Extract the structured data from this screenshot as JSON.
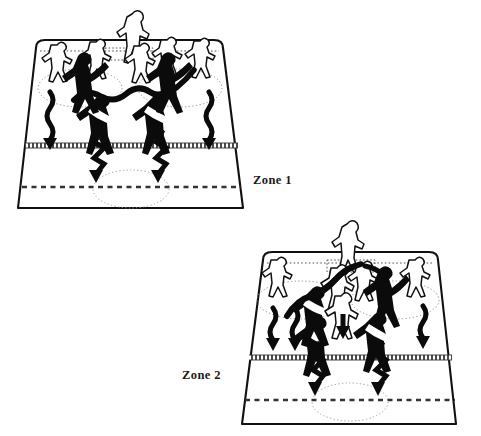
{
  "figure": {
    "type": "tactical-diagram",
    "title": "",
    "background_color": "#ffffff",
    "ink_color": "#111111",
    "hatch_color": "#5a5a5a",
    "dot_color": "#7a7a7a",
    "width": 481,
    "height": 436
  },
  "labels": {
    "zone_1": "Zone 1",
    "zone_2": "Zone 2"
  },
  "diagrams": [
    {
      "id": "diagram-1",
      "label": "Zone 1",
      "pitch": {
        "shape": "trapezoid-perspective",
        "top_width": 188,
        "bottom_width": 232,
        "rounded_top_corners": true
      },
      "lines": [
        {
          "name": "goal-line",
          "style": "dotted",
          "y": 48
        },
        {
          "name": "mid-hatched-line",
          "style": "hatched-thick",
          "y": 146
        },
        {
          "name": "far-dashed-line",
          "style": "dashed",
          "y": 186
        }
      ],
      "ellipses": [
        {
          "name": "left-zone-ellipse",
          "cx": 80,
          "cy": 88,
          "rx": 40,
          "ry": 18,
          "style": "dotted"
        },
        {
          "name": "right-zone-ellipse",
          "cx": 176,
          "cy": 88,
          "rx": 40,
          "ry": 18,
          "style": "dotted"
        },
        {
          "name": "bottom-zone-ellipse",
          "cx": 131,
          "cy": 188,
          "rx": 37,
          "ry": 18,
          "style": "dotted"
        }
      ],
      "players": {
        "outline_count": 6,
        "filled_count": 4,
        "keeper_count": 1
      },
      "arrows": {
        "wavy_down": 2,
        "zigzag_down": 2
      },
      "ball_path": {
        "name": "pass-curve",
        "style": "thick-wavy"
      }
    },
    {
      "id": "diagram-2",
      "label": "Zone 2",
      "pitch": {
        "shape": "trapezoid-perspective",
        "top_width": 188,
        "bottom_width": 232,
        "rounded_top_corners": true
      },
      "lines": [
        {
          "name": "goal-line",
          "style": "dotted",
          "y": 48
        },
        {
          "name": "mid-hatched-line",
          "style": "hatched-thick",
          "y": 140
        },
        {
          "name": "far-dashed-line",
          "style": "dashed",
          "y": 180
        }
      ],
      "ellipses": [
        {
          "name": "left-zone-ellipse",
          "cx": 80,
          "cy": 84,
          "rx": 42,
          "ry": 18,
          "style": "dotted"
        },
        {
          "name": "right-zone-ellipse",
          "cx": 178,
          "cy": 84,
          "rx": 42,
          "ry": 18,
          "style": "dotted"
        },
        {
          "name": "bottom-zone-ellipse",
          "cx": 131,
          "cy": 182,
          "rx": 37,
          "ry": 18,
          "style": "dotted"
        }
      ],
      "players": {
        "outline_count": 6,
        "filled_count": 4,
        "keeper_count": 1
      },
      "arrows": {
        "wavy_down": 2,
        "straight_down": 2,
        "zigzag_down": 2
      },
      "ball_path": {
        "name": "pass-curve",
        "style": "thick-wavy"
      }
    }
  ]
}
